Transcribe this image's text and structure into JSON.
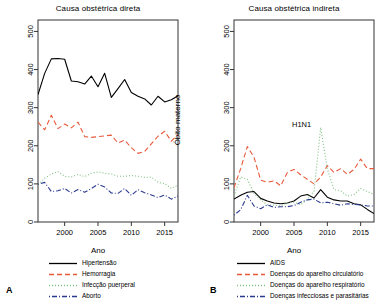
{
  "figure": {
    "width": 392,
    "height": 305,
    "background": "#ffffff"
  },
  "panels": [
    {
      "letter": "A",
      "title": "Causa obstétrica direta",
      "ylabel": "Óbito materno",
      "xlabel": "Ano",
      "legend": [
        {
          "label": "Hipertensão",
          "color": "#000000",
          "style": "solid"
        },
        {
          "label": "Hemorragia",
          "color": "#E8593A",
          "style": "dashed"
        },
        {
          "label": "Infecção puerperal",
          "color": "#7FBF7F",
          "style": "dotted"
        },
        {
          "label": "Aborto",
          "color": "#2B3A8F",
          "style": "dotdash"
        }
      ]
    },
    {
      "letter": "B",
      "title": "Causa obstétrica indireta",
      "ylabel": "Óbito materno",
      "xlabel": "Ano",
      "annotation": "H1N1",
      "legend": [
        {
          "label": "AIDS",
          "color": "#000000",
          "style": "solid"
        },
        {
          "label": "Doenças do aparelho circulatório",
          "color": "#E8593A",
          "style": "dashed"
        },
        {
          "label": "Doenças do aparelho respiratório",
          "color": "#7FBF7F",
          "style": "dotted"
        },
        {
          "label": "Doenças infecciosas e parasitárias",
          "color": "#2B3A8F",
          "style": "dotdash"
        }
      ]
    }
  ],
  "chart_data": [
    {
      "panel": "A",
      "type": "line",
      "title": "Causa obstétrica direta",
      "xlabel": "Ano",
      "ylabel": "Óbito materno",
      "xlim": [
        1996,
        2017
      ],
      "ylim": [
        0,
        530
      ],
      "xticks": [
        2000,
        2005,
        2010,
        2015
      ],
      "yticks": [
        0,
        100,
        200,
        300,
        400,
        500
      ],
      "grid": false,
      "legend_position": "below",
      "x": [
        1996,
        1997,
        1998,
        1999,
        2000,
        2001,
        2002,
        2003,
        2004,
        2005,
        2006,
        2007,
        2008,
        2009,
        2010,
        2011,
        2012,
        2013,
        2014,
        2015,
        2016,
        2017
      ],
      "series": [
        {
          "name": "Hipertensão",
          "color": "#000000",
          "style": "solid",
          "values": [
            334,
            390,
            428,
            429,
            427,
            370,
            368,
            362,
            383,
            355,
            390,
            327,
            350,
            374,
            340,
            330,
            323,
            307,
            330,
            315,
            321,
            331
          ]
        },
        {
          "name": "Hemorragia",
          "color": "#E8593A",
          "style": "dashed",
          "values": [
            262,
            242,
            280,
            245,
            257,
            247,
            262,
            224,
            222,
            224,
            226,
            228,
            207,
            215,
            195,
            180,
            185,
            205,
            225,
            238,
            212,
            230
          ]
        },
        {
          "name": "Infecção puerperal",
          "color": "#7FBF7F",
          "style": "dotted",
          "values": [
            98,
            115,
            126,
            132,
            120,
            118,
            125,
            119,
            128,
            131,
            128,
            126,
            120,
            120,
            122,
            120,
            117,
            118,
            104,
            101,
            88,
            97
          ]
        },
        {
          "name": "Aborto",
          "color": "#2B3A8F",
          "style": "dotdash",
          "values": [
            99,
            104,
            80,
            82,
            88,
            76,
            85,
            78,
            88,
            99,
            92,
            76,
            75,
            88,
            70,
            85,
            77,
            71,
            64,
            71,
            60,
            68
          ]
        }
      ]
    },
    {
      "panel": "B",
      "type": "line",
      "title": "Causa obstétrica indireta",
      "xlabel": "Ano",
      "ylabel": "Óbito materno",
      "xlim": [
        1996,
        2017
      ],
      "ylim": [
        0,
        530
      ],
      "xticks": [
        2000,
        2005,
        2010,
        2015
      ],
      "yticks": [
        0,
        100,
        200,
        300,
        400,
        500
      ],
      "grid": false,
      "legend_position": "below",
      "annotations": [
        {
          "text": "H1N1",
          "x": 2009,
          "y": 245
        }
      ],
      "x": [
        1996,
        1997,
        1998,
        1999,
        2000,
        2001,
        2002,
        2003,
        2004,
        2005,
        2006,
        2007,
        2008,
        2009,
        2010,
        2011,
        2012,
        2013,
        2014,
        2015,
        2016,
        2017
      ],
      "series": [
        {
          "name": "AIDS",
          "color": "#000000",
          "style": "solid",
          "values": [
            60,
            70,
            78,
            80,
            62,
            55,
            50,
            48,
            50,
            55,
            68,
            72,
            63,
            85,
            65,
            58,
            55,
            55,
            48,
            45,
            33,
            22
          ]
        },
        {
          "name": "Doenças do aparelho circulatório",
          "color": "#E8593A",
          "style": "dashed",
          "values": [
            90,
            140,
            198,
            170,
            110,
            104,
            108,
            95,
            130,
            138,
            124,
            112,
            100,
            118,
            148,
            130,
            140,
            125,
            138,
            165,
            140,
            140
          ]
        },
        {
          "name": "Doenças do aparelho respiratório",
          "color": "#7FBF7F",
          "style": "dotted",
          "values": [
            68,
            118,
            112,
            75,
            58,
            45,
            44,
            42,
            50,
            52,
            45,
            60,
            80,
            248,
            140,
            85,
            82,
            68,
            72,
            88,
            80,
            72
          ]
        },
        {
          "name": "Doenças infecciosas e parasitárias",
          "color": "#2B3A8F",
          "style": "dotdash",
          "values": [
            18,
            32,
            70,
            42,
            35,
            45,
            38,
            40,
            40,
            43,
            52,
            58,
            60,
            50,
            52,
            48,
            44,
            48,
            46,
            45,
            42,
            42
          ]
        }
      ]
    }
  ]
}
